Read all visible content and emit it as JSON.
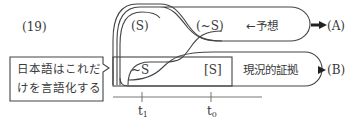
{
  "example_number": "(19)",
  "curve_labels": {
    "s_paren": "(S)",
    "not_s_paren": "(~S)",
    "not_s": "~S",
    "s_bracket": "[S]"
  },
  "annotations": {
    "prediction": "←予想",
    "evidence": "現況的証拠"
  },
  "outcomes": {
    "a": "(A)",
    "b": "(B)"
  },
  "callout": {
    "line1": "日本語はこれだ",
    "line2": "けを言語化する"
  },
  "timeline": {
    "t1_base": "t",
    "t1_sub": "1",
    "t0_base": "t",
    "t0_sub": "0"
  }
}
